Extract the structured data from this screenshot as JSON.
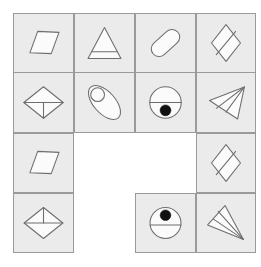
{
  "figure": {
    "type": "shape-grid-puzzle",
    "columns": 4,
    "rows": 4,
    "cell_width": 60,
    "cell_height": 60,
    "background_color": "#ffffff",
    "cell_fill_color": "#ebebeb",
    "cell_border_color": "#9a9a9a",
    "shape_fill_color": "#fbfbfb",
    "shape_stroke_color": "#6e6e6e",
    "dot_color": "#111111"
  },
  "cells": [
    {
      "id": "cell-r1c1",
      "row": 1,
      "col": 1,
      "occupied": true,
      "shape": "parallelogram",
      "shape_label": "parallelogram",
      "rotation_deg": 0,
      "fill": "none",
      "marks": []
    },
    {
      "id": "cell-r1c2",
      "row": 1,
      "col": 2,
      "occupied": true,
      "shape": "triangle",
      "shape_label": "triangle with base line",
      "rotation_deg": 0,
      "fill": "none",
      "marks": [
        "horizontal-line-near-base"
      ]
    },
    {
      "id": "cell-r1c3",
      "row": 1,
      "col": 3,
      "occupied": true,
      "shape": "capsule",
      "shape_label": "rounded rectangle capsule",
      "rotation_deg": -45,
      "fill": "none",
      "marks": []
    },
    {
      "id": "cell-r1c4",
      "row": 1,
      "col": 4,
      "occupied": true,
      "shape": "rhombus",
      "shape_label": "tall rhombus with diagonal",
      "rotation_deg": 0,
      "fill": "none",
      "marks": [
        "diagonal-line"
      ]
    },
    {
      "id": "cell-r2c1",
      "row": 2,
      "col": 1,
      "occupied": true,
      "shape": "rhombus",
      "shape_label": "wide rhombus with downward T",
      "rotation_deg": 0,
      "fill": "none",
      "marks": [
        "horizontal-diameter",
        "vertical-stem-down"
      ]
    },
    {
      "id": "cell-r2c2",
      "row": 2,
      "col": 2,
      "occupied": true,
      "shape": "ellipse",
      "shape_label": "tilted ellipse with small circle",
      "rotation_deg": -55,
      "fill": "none",
      "marks": [
        "small-circle-top"
      ]
    },
    {
      "id": "cell-r2c3",
      "row": 2,
      "col": 3,
      "occupied": true,
      "shape": "circle",
      "shape_label": "circle with diameter and lower dot",
      "rotation_deg": 0,
      "fill": "none",
      "marks": [
        "horizontal-diameter",
        "filled-dot-lower"
      ]
    },
    {
      "id": "cell-r2c4",
      "row": 2,
      "col": 4,
      "occupied": true,
      "shape": "dart",
      "shape_label": "dart pointing right",
      "rotation_deg": 0,
      "fill": "none",
      "marks": [
        "internal-fold-lines"
      ]
    },
    {
      "id": "cell-r3c1",
      "row": 3,
      "col": 1,
      "occupied": true,
      "shape": "parallelogram",
      "shape_label": "parallelogram",
      "rotation_deg": 0,
      "fill": "none",
      "marks": []
    },
    {
      "id": "cell-r3c2",
      "row": 3,
      "col": 2,
      "occupied": false,
      "shape": "none",
      "shape_label": "empty",
      "rotation_deg": 0,
      "fill": "none",
      "marks": []
    },
    {
      "id": "cell-r3c3",
      "row": 3,
      "col": 3,
      "occupied": false,
      "shape": "none",
      "shape_label": "empty",
      "rotation_deg": 0,
      "fill": "none",
      "marks": []
    },
    {
      "id": "cell-r3c4",
      "row": 3,
      "col": 4,
      "occupied": true,
      "shape": "rhombus",
      "shape_label": "tall rhombus with diagonal",
      "rotation_deg": 0,
      "fill": "none",
      "marks": [
        "diagonal-line"
      ]
    },
    {
      "id": "cell-r4c1",
      "row": 4,
      "col": 1,
      "occupied": true,
      "shape": "rhombus",
      "shape_label": "wide rhombus with upward T",
      "rotation_deg": 0,
      "fill": "none",
      "marks": [
        "horizontal-diameter",
        "vertical-stem-up"
      ]
    },
    {
      "id": "cell-r4c2",
      "row": 4,
      "col": 2,
      "occupied": false,
      "shape": "none",
      "shape_label": "empty",
      "rotation_deg": 0,
      "fill": "none",
      "marks": []
    },
    {
      "id": "cell-r4c3",
      "row": 4,
      "col": 3,
      "occupied": true,
      "shape": "circle",
      "shape_label": "circle with diameter and upper dot",
      "rotation_deg": 0,
      "fill": "none",
      "marks": [
        "horizontal-diameter",
        "filled-dot-upper"
      ]
    },
    {
      "id": "cell-r4c4",
      "row": 4,
      "col": 4,
      "occupied": true,
      "shape": "dart",
      "shape_label": "dart pointing down-right",
      "rotation_deg": 0,
      "fill": "none",
      "marks": [
        "internal-fold-lines"
      ]
    }
  ]
}
